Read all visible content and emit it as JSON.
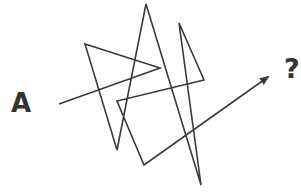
{
  "diagram": {
    "start_label": "A",
    "end_label": "?",
    "line_color": "#3a3a3a",
    "line_width": 1.6,
    "path_points": [
      [
        59,
        104
      ],
      [
        160,
        68
      ],
      [
        85,
        44
      ],
      [
        117,
        150
      ],
      [
        146,
        4
      ],
      [
        201,
        185
      ],
      [
        179,
        23
      ],
      [
        204,
        80
      ],
      [
        117,
        101
      ],
      [
        144,
        165
      ],
      [
        268,
        77
      ]
    ],
    "arrowhead": "end"
  }
}
